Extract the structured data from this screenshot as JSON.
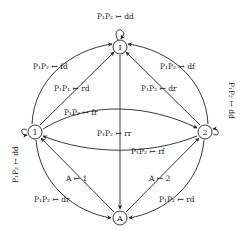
{
  "diagram": {
    "type": "state-transition-graph",
    "nodes": {
      "I": {
        "label": "I",
        "x": 120,
        "y": 47
      },
      "n1": {
        "label": "1",
        "x": 35,
        "y": 132
      },
      "n2": {
        "label": "2",
        "x": 205,
        "y": 132
      },
      "A": {
        "label": "A",
        "x": 120,
        "y": 218
      }
    },
    "edges": [
      {
        "id": "I-self",
        "from": "I",
        "to": "I",
        "label": "P₁P₂ ↦ dd"
      },
      {
        "id": "1-I-outer",
        "from": "1",
        "to": "I",
        "label": "P₁P₂ ↦ fd"
      },
      {
        "id": "1-I-inner",
        "from": "1",
        "to": "I",
        "label": "P₁P₁ ↦ rd"
      },
      {
        "id": "2-I-outer",
        "from": "2",
        "to": "I",
        "label": "P₁P₂ ↦ df"
      },
      {
        "id": "2-I-inner",
        "from": "2",
        "to": "I",
        "label": "P₁P₂ ↦ dr"
      },
      {
        "id": "1-2",
        "from": "1",
        "to": "2",
        "label": "P₁P₂ ↦ fr"
      },
      {
        "id": "I-A",
        "from": "I",
        "to": "A",
        "label": "P₁P₂ ↦ rr"
      },
      {
        "id": "2-1",
        "from": "2",
        "to": "1",
        "label": "P₁P₂ ↦ rf"
      },
      {
        "id": "1-self",
        "from": "1",
        "to": "1",
        "label": "P₁P₂ ↦ dd"
      },
      {
        "id": "2-self",
        "from": "2",
        "to": "2",
        "label": "P₁P₂ ↦ dd"
      },
      {
        "id": "A-1",
        "from": "A",
        "to": "1",
        "label": "A ↦ 1"
      },
      {
        "id": "A-2",
        "from": "A",
        "to": "2",
        "label": "A ↦ 2"
      },
      {
        "id": "1-A",
        "from": "1",
        "to": "A",
        "label": "P₁P₂ ↦ dr"
      },
      {
        "id": "2-A",
        "from": "2",
        "to": "A",
        "label": "P₁P₂ ↦ rd"
      }
    ]
  }
}
